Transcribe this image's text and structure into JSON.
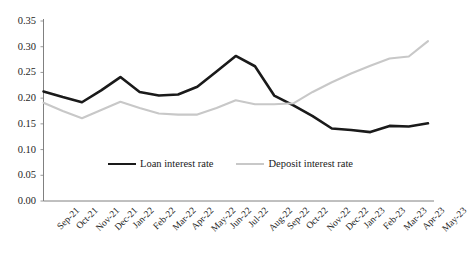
{
  "chart_data": {
    "type": "line",
    "title": "",
    "xlabel": "",
    "ylabel": "",
    "ylim": [
      0.0,
      0.35
    ],
    "ytick_labels": [
      "0.00",
      "0.05",
      "0.10",
      "0.15",
      "0.20",
      "0.25",
      "0.30",
      "0.35"
    ],
    "ytick_values": [
      0.0,
      0.05,
      0.1,
      0.15,
      0.2,
      0.25,
      0.3,
      0.35
    ],
    "grid": false,
    "legend_position": "inside-bottom-center",
    "categories": [
      "Sep-21",
      "Oct-21",
      "Nov-21",
      "Dec-21",
      "Jan-22",
      "Feb-22",
      "Mar-22",
      "Apr-22",
      "May-22",
      "Jun-22",
      "Jul-22",
      "Aug-22",
      "Sep-22",
      "Oct-22",
      "Nov-22",
      "Dec-22",
      "Jan-23",
      "Feb-23",
      "Mar-23",
      "Apr-23",
      "May-23"
    ],
    "series": [
      {
        "name": "Loan interest rate",
        "color": "#1a1a1a",
        "values": [
          0.213,
          0.202,
          0.192,
          0.215,
          0.241,
          0.212,
          0.205,
          0.207,
          0.222,
          0.252,
          0.282,
          0.262,
          0.205,
          0.186,
          0.165,
          0.141,
          0.138,
          0.134,
          0.146,
          0.145,
          0.151
        ]
      },
      {
        "name": "Deposit interest rate",
        "color": "#c8c8c8",
        "values": [
          0.191,
          0.175,
          0.161,
          0.177,
          0.193,
          0.181,
          0.17,
          0.168,
          0.168,
          0.181,
          0.196,
          0.188,
          0.188,
          0.19,
          0.212,
          0.231,
          0.248,
          0.263,
          0.277,
          0.281,
          0.311
        ]
      }
    ]
  },
  "legend": {
    "entries": [
      {
        "label": "Loan interest rate"
      },
      {
        "label": "Deposit interest rate"
      }
    ]
  },
  "axis": {
    "y_ticks": [
      "0.35",
      "0.30",
      "0.25",
      "0.20",
      "0.15",
      "0.10",
      "0.05",
      "0.00"
    ],
    "x_ticks": [
      "Sep-21",
      "Oct-21",
      "Nov-21",
      "Dec-21",
      "Jan-22",
      "Feb-22",
      "Mar-22",
      "Apr-22",
      "May-22",
      "Jun-22",
      "Jul-22",
      "Aug-22",
      "Sep-22",
      "Oct-22",
      "Nov-22",
      "Dec-22",
      "Jan-23",
      "Feb-23",
      "Mar-23",
      "Apr-23",
      "May-23"
    ]
  },
  "colors": {
    "loan": "#1a1a1a",
    "deposit": "#c8c8c8",
    "axis": "#808080",
    "text": "#262626",
    "background": "#ffffff"
  }
}
